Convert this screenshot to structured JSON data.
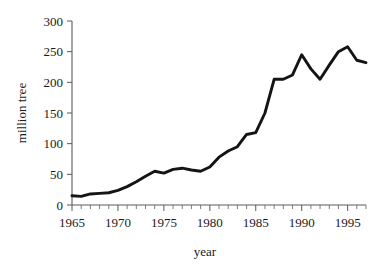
{
  "chart_data": {
    "type": "line",
    "title": "",
    "xlabel": "year",
    "ylabel": "million tree",
    "xlim": [
      1965,
      1997
    ],
    "ylim": [
      0,
      300
    ],
    "grid": false,
    "legend": false,
    "legend_position": "none",
    "x_ticks_major": [
      1965,
      1970,
      1975,
      1980,
      1985,
      1990,
      1995
    ],
    "x_tick_labels": [
      "1965",
      "1970",
      "1975",
      "1980",
      "1985",
      "1990",
      "1995"
    ],
    "x_minor_tick_interval": 1,
    "y_ticks": [
      0,
      50,
      100,
      150,
      200,
      250,
      300
    ],
    "y_tick_labels": [
      "0",
      "50",
      "100",
      "150",
      "200",
      "250",
      "300"
    ],
    "series": [
      {
        "name": "million trees",
        "color": "#141414",
        "x": [
          1965,
          1966,
          1967,
          1968,
          1969,
          1970,
          1971,
          1972,
          1973,
          1974,
          1975,
          1976,
          1977,
          1978,
          1979,
          1980,
          1981,
          1982,
          1983,
          1984,
          1985,
          1986,
          1987,
          1988,
          1989,
          1990,
          1991,
          1992,
          1993,
          1994,
          1995,
          1996,
          1997
        ],
        "values": [
          15,
          14,
          18,
          19,
          20,
          24,
          30,
          38,
          47,
          55,
          52,
          58,
          60,
          57,
          55,
          62,
          78,
          88,
          95,
          115,
          118,
          150,
          205,
          205,
          212,
          245,
          222,
          205,
          228,
          250,
          258,
          236,
          232
        ]
      }
    ]
  }
}
